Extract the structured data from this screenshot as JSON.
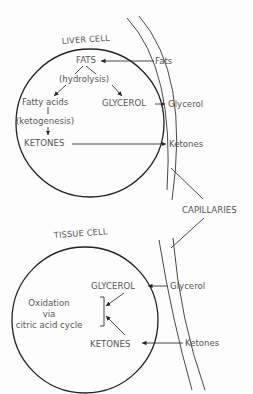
{
  "liver_cell": {
    "title": "LIVER CELL",
    "fats": "FATS",
    "hydrolysis": "(hydrolysis)",
    "fatty_acids": "Fatty acids",
    "glycerol": "GLYCEROL",
    "ketogenesis": "(ketogenesis)",
    "ketones": "KETONES"
  },
  "capillary_upper": {
    "fats": "Fats",
    "glycerol": "Glycerol",
    "ketones": "Ketones"
  },
  "capillaries_label": "CAPILLARIES",
  "tissue_cell": {
    "title": "TISSUE CELL",
    "glycerol": "GLYCEROL",
    "oxidation_line1": "Oxidation",
    "oxidation_line2": "via",
    "oxidation_line3": "citric acid cycle",
    "ketones": "KETONES"
  },
  "capillary_lower": {
    "glycerol": "Glycerol",
    "ketones": "Ketones"
  }
}
